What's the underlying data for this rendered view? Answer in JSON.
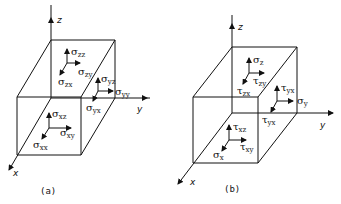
{
  "figure": {
    "panels": [
      {
        "caption": "(a)",
        "axes": {
          "x": "x",
          "y": "y",
          "z": "z"
        },
        "labels": [
          {
            "sym": "σ",
            "sub": "zz"
          },
          {
            "sym": "σ",
            "sub": "zy"
          },
          {
            "sym": "σ",
            "sub": "zx"
          },
          {
            "sym": "σ",
            "sub": "yz"
          },
          {
            "sym": "σ",
            "sub": "yy"
          },
          {
            "sym": "σ",
            "sub": "yx"
          },
          {
            "sym": "σ",
            "sub": "xz"
          },
          {
            "sym": "σ",
            "sub": "xy"
          },
          {
            "sym": "σ",
            "sub": "xx"
          }
        ]
      },
      {
        "caption": "(b)",
        "axes": {
          "x": "x",
          "y": "y",
          "z": "z"
        },
        "labels": [
          {
            "sym": "σ",
            "sub": "z"
          },
          {
            "sym": "τ",
            "sub": "zy"
          },
          {
            "sym": "τ",
            "sub": "zx"
          },
          {
            "sym": "τ",
            "sub": "yx"
          },
          {
            "sym": "σ",
            "sub": "y"
          },
          {
            "sym": "τ",
            "sub": "yx"
          },
          {
            "sym": "τ",
            "sub": "xz"
          },
          {
            "sym": "τ",
            "sub": "xy"
          },
          {
            "sym": "σ",
            "sub": "x"
          }
        ]
      }
    ]
  }
}
